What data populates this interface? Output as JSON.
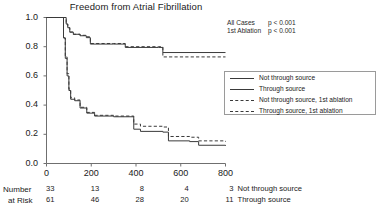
{
  "chart_data": {
    "type": "line",
    "title": "Freedom from Atrial Fibrillation",
    "xlabel": "",
    "ylabel": "",
    "xlim": [
      0,
      800
    ],
    "ylim": [
      0.0,
      1.0
    ],
    "grid": false,
    "legend_position": "right",
    "xticks": [
      "0",
      "200",
      "400",
      "600",
      "800"
    ],
    "xtick_values": [
      0,
      200,
      400,
      600,
      800
    ],
    "yticks": [
      "0.0",
      "0.2",
      "0.4",
      "0.6",
      "0.8",
      "1.0"
    ],
    "ytick_values": [
      0.0,
      0.2,
      0.4,
      0.6,
      0.8,
      1.0
    ],
    "annotations": [
      {
        "label": "All Cases",
        "text": "p < 0.001"
      },
      {
        "label": "1st Ablation",
        "text": "p < 0.001"
      }
    ],
    "series": [
      {
        "name": "Not through source",
        "style": "solid",
        "color": "#3a3a3a",
        "points": [
          [
            0,
            1.0
          ],
          [
            78,
            1.0
          ],
          [
            88,
            0.955
          ],
          [
            95,
            0.93
          ],
          [
            104,
            0.9
          ],
          [
            120,
            0.885
          ],
          [
            150,
            0.875
          ],
          [
            178,
            0.862
          ],
          [
            196,
            0.818
          ],
          [
            300,
            0.818
          ],
          [
            352,
            0.795
          ],
          [
            500,
            0.795
          ],
          [
            520,
            0.76
          ],
          [
            800,
            0.76
          ]
        ]
      },
      {
        "name": "Through source",
        "style": "solid",
        "color": "#3a3a3a",
        "points": [
          [
            0,
            1.0
          ],
          [
            70,
            1.0
          ],
          [
            76,
            0.86
          ],
          [
            84,
            0.72
          ],
          [
            92,
            0.6
          ],
          [
            100,
            0.5
          ],
          [
            108,
            0.44
          ],
          [
            126,
            0.43
          ],
          [
            150,
            0.38
          ],
          [
            180,
            0.345
          ],
          [
            215,
            0.325
          ],
          [
            300,
            0.32
          ],
          [
            390,
            0.235
          ],
          [
            420,
            0.22
          ],
          [
            520,
            0.215
          ],
          [
            545,
            0.155
          ],
          [
            640,
            0.15
          ],
          [
            680,
            0.125
          ],
          [
            800,
            0.12
          ]
        ]
      },
      {
        "name": "Not through source, 1st ablation",
        "style": "dashed",
        "color": "#3a3a3a",
        "points": [
          [
            0,
            1.0
          ],
          [
            78,
            1.0
          ],
          [
            88,
            0.955
          ],
          [
            95,
            0.93
          ],
          [
            104,
            0.9
          ],
          [
            120,
            0.885
          ],
          [
            150,
            0.878
          ],
          [
            178,
            0.868
          ],
          [
            196,
            0.822
          ],
          [
            300,
            0.822
          ],
          [
            352,
            0.8
          ],
          [
            500,
            0.8
          ],
          [
            520,
            0.73
          ],
          [
            800,
            0.73
          ]
        ]
      },
      {
        "name": "Through source, 1st ablation",
        "style": "dashed",
        "color": "#3a3a3a",
        "points": [
          [
            0,
            1.0
          ],
          [
            70,
            1.0
          ],
          [
            76,
            0.86
          ],
          [
            84,
            0.73
          ],
          [
            92,
            0.615
          ],
          [
            100,
            0.51
          ],
          [
            108,
            0.45
          ],
          [
            126,
            0.435
          ],
          [
            150,
            0.385
          ],
          [
            180,
            0.35
          ],
          [
            215,
            0.33
          ],
          [
            300,
            0.325
          ],
          [
            390,
            0.27
          ],
          [
            420,
            0.255
          ],
          [
            520,
            0.25
          ],
          [
            545,
            0.185
          ],
          [
            640,
            0.18
          ],
          [
            680,
            0.155
          ],
          [
            800,
            0.15
          ]
        ]
      }
    ],
    "risk_table": {
      "row_label_line1": "Number",
      "row_label_line2": "at Risk",
      "times": [
        0,
        200,
        400,
        600,
        800
      ],
      "rows": [
        {
          "name": "Not through source",
          "values": [
            "33",
            "13",
            "8",
            "4",
            "3"
          ]
        },
        {
          "name": "Through source",
          "values": [
            "61",
            "46",
            "28",
            "20",
            "11"
          ]
        }
      ]
    }
  }
}
